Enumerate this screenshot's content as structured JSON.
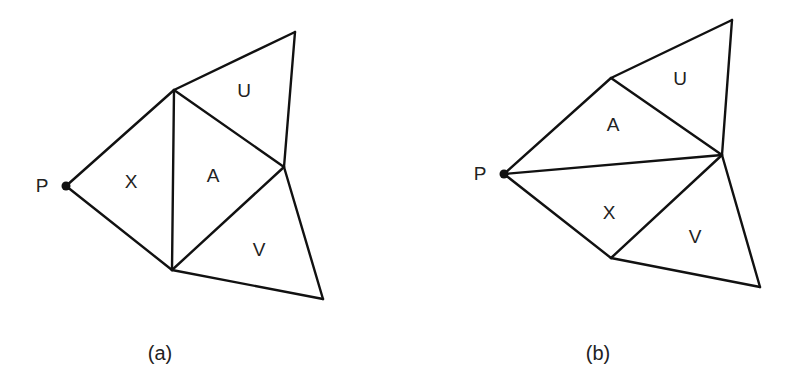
{
  "figure": {
    "panels": [
      {
        "caption": "(a)",
        "point_label": "P",
        "regions": {
          "X": "X",
          "A": "A",
          "U": "U",
          "V": "V"
        },
        "vertices": {
          "P": [
            66,
            186
          ],
          "T": [
            174,
            90
          ],
          "UT": [
            295,
            32
          ],
          "R": [
            284,
            167
          ],
          "B": [
            172,
            270
          ],
          "VB": [
            323,
            299
          ]
        },
        "edges": [
          [
            "P",
            "T"
          ],
          [
            "P",
            "B"
          ],
          [
            "T",
            "B"
          ],
          [
            "T",
            "R"
          ],
          [
            "B",
            "R"
          ],
          [
            "T",
            "UT"
          ],
          [
            "UT",
            "R"
          ],
          [
            "R",
            "VB"
          ],
          [
            "B",
            "VB"
          ]
        ]
      },
      {
        "caption": "(b)",
        "point_label": "P",
        "regions": {
          "X": "X",
          "A": "A",
          "U": "U",
          "V": "V"
        },
        "vertices": {
          "P": [
            504,
            174
          ],
          "T": [
            611,
            78
          ],
          "UT": [
            732,
            20
          ],
          "R": [
            722,
            155
          ],
          "B": [
            611,
            258
          ],
          "VB": [
            760,
            287
          ]
        },
        "edges": [
          [
            "P",
            "T"
          ],
          [
            "P",
            "B"
          ],
          [
            "P",
            "R"
          ],
          [
            "T",
            "R"
          ],
          [
            "B",
            "R"
          ],
          [
            "T",
            "UT"
          ],
          [
            "UT",
            "R"
          ],
          [
            "R",
            "VB"
          ],
          [
            "B",
            "VB"
          ]
        ]
      }
    ]
  }
}
